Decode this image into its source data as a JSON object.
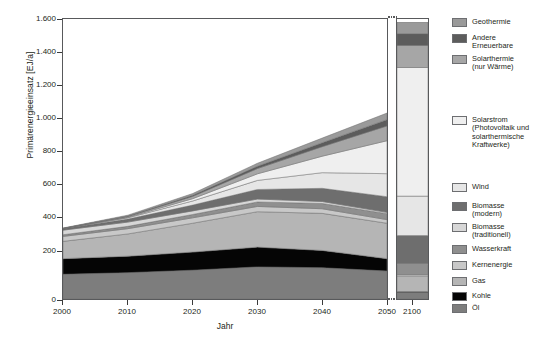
{
  "chart_data": {
    "type": "area",
    "title": "",
    "xlabel": "Jahr",
    "ylabel": "Primärenergieeinsatz [EJ/a]",
    "ylim": [
      0,
      1700
    ],
    "yticks": [
      0,
      200,
      400,
      600,
      800,
      1000,
      1200,
      1400,
      1600
    ],
    "ytick_labels": [
      "0",
      "200",
      "400",
      "600",
      "800",
      "1.000",
      "1.200",
      "1.400",
      "1.600"
    ],
    "xticks": [
      2000,
      2010,
      2020,
      2030,
      2040,
      2050
    ],
    "xtick_labels": [
      "2000",
      "2010",
      "2020",
      "2030",
      "2040",
      "2050"
    ],
    "x_break_label": "2100",
    "grid": false,
    "legend_position": "right",
    "x": [
      2000,
      2010,
      2020,
      2030,
      2040,
      2050
    ],
    "x_far": 2100,
    "stack_order_bottom_to_top": [
      "Öl",
      "Kohle",
      "Gas",
      "Kernenergie",
      "Wasserkraft",
      "Biomasse (traditionell)",
      "Biomasse (modern)",
      "Wind",
      "Solarstrom (Photovoltaik und solarthermische Kraftwerke)",
      "Solarthermie (nur Wärme)",
      "Andere Erneuerbare",
      "Geothermie"
    ],
    "series": [
      {
        "name": "Öl",
        "color": "#7d7d7d",
        "values": [
          150,
          160,
          175,
          195,
          190,
          170
        ],
        "value_2100": 40
      },
      {
        "name": "Kohle",
        "color": "#050505",
        "values": [
          95,
          100,
          110,
          120,
          105,
          75
        ],
        "value_2100": 5
      },
      {
        "name": "Gas",
        "color": "#b5b5b5",
        "values": [
          105,
          135,
          175,
          215,
          225,
          215
        ],
        "value_2100": 95
      },
      {
        "name": "Kernenergie",
        "color": "#c8c8c8",
        "values": [
          30,
          32,
          33,
          32,
          28,
          22
        ],
        "value_2100": 10
      },
      {
        "name": "Wasserkraft",
        "color": "#8f8f8f",
        "values": [
          10,
          14,
          20,
          27,
          32,
          36
        ],
        "value_2100": 60
      },
      {
        "name": "Biomasse (traditionell)",
        "color": "#d7d7d7",
        "values": [
          28,
          26,
          22,
          18,
          12,
          8
        ],
        "value_2100": 5
      },
      {
        "name": "Biomasse (modern)",
        "color": "#6e6e6e",
        "values": [
          8,
          18,
          35,
          58,
          80,
          95
        ],
        "value_2100": 170
      },
      {
        "name": "Wind",
        "color": "#e6e6e6",
        "values": [
          1,
          8,
          25,
          55,
          95,
          140
        ],
        "value_2100": 240
      },
      {
        "name": "Solarstrom (Photovoltaik und solarthermische Kraftwerke)",
        "color": "#efefef",
        "values": [
          0,
          3,
          14,
          40,
          100,
          200
        ],
        "value_2100": 780
      },
      {
        "name": "Solarthermie (nur Wärme)",
        "color": "#a6a6a6",
        "values": [
          1,
          5,
          14,
          32,
          58,
          90
        ],
        "value_2100": 135
      },
      {
        "name": "Andere Erneuerbare",
        "color": "#5c5c5c",
        "values": [
          1,
          3,
          7,
          14,
          24,
          38
        ],
        "value_2100": 70
      },
      {
        "name": "Geothermie",
        "color": "#9a9a9a",
        "values": [
          2,
          5,
          10,
          18,
          28,
          40
        ],
        "value_2100": 70
      }
    ],
    "totals": [
      431,
      509,
      640,
      824,
      977,
      1129
    ],
    "total_2100": 1680
  },
  "legend": {
    "items": [
      {
        "label": "Geothermie",
        "color": "#9a9a9a",
        "icon": "legend-swatch",
        "top": 10
      },
      {
        "label": "Andere\nErneuerbare",
        "color": "#5c5c5c",
        "icon": "legend-swatch",
        "top": 26
      },
      {
        "label": "Solarthermie\n(nur Wärme)",
        "color": "#a6a6a6",
        "icon": "legend-swatch",
        "top": 47
      },
      {
        "label": "Solarstrom\n(Photovoltaik und\nsolarthermische\nKraftwerke)",
        "color": "#efefef",
        "icon": "legend-swatch",
        "top": 108
      },
      {
        "label": "Wind",
        "color": "#e6e6e6",
        "icon": "legend-swatch",
        "top": 175
      },
      {
        "label": "Biomasse\n(modern)",
        "color": "#6e6e6e",
        "icon": "legend-swatch",
        "top": 194
      },
      {
        "label": "Biomasse\n(traditionell)",
        "color": "#d7d7d7",
        "icon": "legend-swatch",
        "top": 215
      },
      {
        "label": "Wasserkraft",
        "color": "#8f8f8f",
        "icon": "legend-swatch",
        "top": 237
      },
      {
        "label": "Kernenergie",
        "color": "#c8c8c8",
        "icon": "legend-swatch",
        "top": 253
      },
      {
        "label": "Gas",
        "color": "#b5b5b5",
        "icon": "legend-swatch",
        "top": 269
      },
      {
        "label": "Kohle",
        "color": "#050505",
        "icon": "legend-swatch",
        "top": 284
      },
      {
        "label": "Öl",
        "color": "#7d7d7d",
        "icon": "legend-swatch",
        "top": 296
      }
    ]
  },
  "axes": {
    "y_label": "Primärenergieeinsatz [EJ/a]",
    "x_label": "Jahr",
    "y_ticks": [
      "1.600",
      "1.400",
      "1.200",
      "1.000",
      "800",
      "600",
      "400",
      "200",
      "0"
    ],
    "x_ticks": [
      "2000",
      "2010",
      "2020",
      "2030",
      "2040",
      "2050"
    ],
    "x_tick_far": "2100"
  }
}
